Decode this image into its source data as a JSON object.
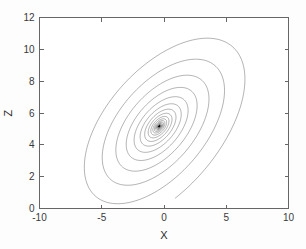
{
  "figure": {
    "background_color": "#fdfdfd",
    "plot_background_color": "#ffffff",
    "axis_color": "#666666",
    "trace_color": "#141414"
  },
  "chart_data": {
    "type": "line",
    "title": "",
    "subtitle": "",
    "xlabel": "X",
    "ylabel": "Z",
    "xlim": [
      -10,
      10
    ],
    "ylim": [
      0,
      12
    ],
    "xticks": [
      -10,
      -5,
      0,
      5,
      10
    ],
    "xticklabels": [
      "-10",
      "-5",
      "0",
      "5",
      "10"
    ],
    "yticks": [
      0,
      2,
      4,
      6,
      8,
      10,
      12
    ],
    "yticklabels": [
      "0",
      "2",
      "4",
      "6",
      "8",
      "10",
      "12"
    ],
    "grid": false,
    "legend": false,
    "legend_position": "none",
    "series": [
      {
        "name": "attractor-trajectory",
        "description": "Chaotic double-scroll (butterfly) attractor projected onto the X-Z plane",
        "color": "#141414",
        "linewidth": 0.4,
        "generator": {
          "system": "lorenz-like",
          "sigma": 10,
          "rho": 13.5,
          "beta": 2.0,
          "dt": 0.0035,
          "steps": 120000,
          "x0": 0.8,
          "y0": 0.6,
          "z0": 6.0,
          "x_scale": 0.62,
          "z_scale": 0.62,
          "z_offset": 0.25
        },
        "extents": {
          "x_min": -6.4,
          "x_max": 6.5,
          "z_min": 0.3,
          "z_max": 10.7
        },
        "features": {
          "left_eye_center": [
            -2.6,
            5.6
          ],
          "right_eye_center": [
            2.2,
            5.6
          ],
          "cusp_bottom": [
            -0.2,
            0.35
          ],
          "center_notch": [
            0.2,
            8.6
          ],
          "left_wing_tip": [
            -5.9,
            9.9
          ],
          "right_wing_tip": [
            5.8,
            9.9
          ]
        }
      }
    ]
  }
}
